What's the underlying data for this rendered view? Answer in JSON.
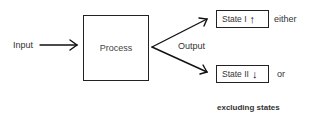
{
  "diagram": {
    "input_label": "Input",
    "process_label": "Process",
    "output_label": "Output",
    "states": [
      {
        "label": "State I",
        "arrow_icon": "↑",
        "arrow_name": "up-arrow",
        "suffix": "either"
      },
      {
        "label": "State II",
        "arrow_icon": "↓",
        "arrow_name": "down-arrow",
        "suffix": "or"
      }
    ],
    "footer": "excluding states"
  }
}
